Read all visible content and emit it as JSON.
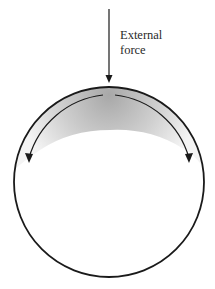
{
  "diagram": {
    "force_label_line1": "External",
    "force_label_line2": "force",
    "colors": {
      "stroke": "#1a1a1a",
      "shade_dark": "#b8b8b8",
      "shade_light": "#f2f2f2",
      "background": "#ffffff"
    },
    "elements": {
      "outer_circle": "sphere-outline",
      "force_arrow": "downward-arrow",
      "inner_arrows": [
        "left-curved-arrow",
        "right-curved-arrow"
      ],
      "shaded_region": "stress-gradient"
    }
  }
}
